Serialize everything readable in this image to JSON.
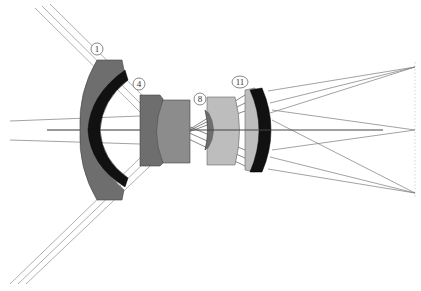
{
  "diagram": {
    "type": "optical-lens-layout",
    "colors": {
      "background": "#ffffff",
      "ray": "#7a7a7a",
      "ray_dark": "#444444",
      "lens_dark_gray": "#6e6e6e",
      "lens_mid_gray": "#8c8c8c",
      "lens_light_gray": "#bdbdbd",
      "lens_black": "#111111",
      "image_plane": "#bbbbbb",
      "label_stroke": "#555555"
    },
    "labels": [
      {
        "id": "1",
        "text": "1",
        "x": 97,
        "y": 49
      },
      {
        "id": "4",
        "text": "4",
        "x": 139,
        "y": 84
      },
      {
        "id": "8",
        "text": "8",
        "x": 200,
        "y": 99
      },
      {
        "id": "11",
        "text": "11",
        "x": 240,
        "y": 82
      }
    ],
    "focus_points": [
      {
        "name": "top-field",
        "x": 415,
        "y": 67
      },
      {
        "name": "on-axis",
        "x": 415,
        "y": 130
      },
      {
        "name": "bottom-field",
        "x": 415,
        "y": 193
      }
    ]
  }
}
